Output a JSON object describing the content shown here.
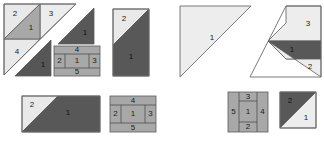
{
  "diagram": {
    "background": "#ffffff",
    "palette": {
      "light": "#e9e9e9",
      "light_alt": "#ededed",
      "medium": "#a8a8a8",
      "medium_alt": "#b0b0b0",
      "dark": "#585858",
      "dark_alt": "#565656",
      "outline": "#6b6b6b",
      "label_text": "#1b1b1b"
    },
    "figures": [
      {
        "id": "figure-1",
        "name": "large-triangle-with-square-inset",
        "kind": "triangle",
        "regions": [
          {
            "label": "2",
            "shade": "light"
          },
          {
            "label": "1",
            "shade": "medium"
          },
          {
            "label": "3",
            "shade": "light"
          },
          {
            "label": "4",
            "shade": "light"
          }
        ]
      },
      {
        "id": "figure-2",
        "name": "dark-triangle-upper",
        "kind": "triangle",
        "regions": [
          {
            "label": "1",
            "shade": "dark"
          }
        ]
      },
      {
        "id": "figure-3",
        "name": "dark-triangle-lower",
        "kind": "triangle",
        "regions": [
          {
            "label": "1",
            "shade": "dark"
          }
        ]
      },
      {
        "id": "figure-4",
        "name": "five-region-square-upper",
        "kind": "square",
        "regions": [
          {
            "label": "4",
            "shade": "medium"
          },
          {
            "label": "2",
            "shade": "medium"
          },
          {
            "label": "1",
            "shade": "medium"
          },
          {
            "label": "3",
            "shade": "medium"
          },
          {
            "label": "5",
            "shade": "medium"
          }
        ]
      },
      {
        "id": "figure-5",
        "name": "tall-rectangle-two-region",
        "kind": "rectangle",
        "regions": [
          {
            "label": "2",
            "shade": "light"
          },
          {
            "label": "1",
            "shade": "dark"
          }
        ]
      },
      {
        "id": "figure-6",
        "name": "wide-rectangle-two-region",
        "kind": "rectangle",
        "regions": [
          {
            "label": "2",
            "shade": "light"
          },
          {
            "label": "1",
            "shade": "dark"
          }
        ]
      },
      {
        "id": "figure-7",
        "name": "five-region-square-lower",
        "kind": "square",
        "regions": [
          {
            "label": "4",
            "shade": "medium"
          },
          {
            "label": "2",
            "shade": "medium"
          },
          {
            "label": "1",
            "shade": "medium"
          },
          {
            "label": "3",
            "shade": "medium"
          },
          {
            "label": "5",
            "shade": "medium"
          }
        ]
      },
      {
        "id": "figure-8",
        "name": "large-light-triangle",
        "kind": "triangle",
        "regions": [
          {
            "label": "1",
            "shade": "light"
          }
        ]
      },
      {
        "id": "figure-9",
        "name": "triangle-three-region",
        "kind": "triangle",
        "regions": [
          {
            "label": "3",
            "shade": "light"
          },
          {
            "label": "1",
            "shade": "dark"
          },
          {
            "label": "2",
            "shade": "light"
          }
        ]
      },
      {
        "id": "figure-10",
        "name": "five-region-square-right",
        "kind": "square",
        "regions": [
          {
            "label": "3",
            "shade": "medium"
          },
          {
            "label": "5",
            "shade": "medium"
          },
          {
            "label": "1",
            "shade": "medium"
          },
          {
            "label": "4",
            "shade": "medium"
          },
          {
            "label": "2",
            "shade": "medium"
          }
        ]
      },
      {
        "id": "figure-11",
        "name": "square-two-region-dark-light",
        "kind": "square",
        "regions": [
          {
            "label": "2",
            "shade": "dark"
          },
          {
            "label": "1",
            "shade": "light"
          }
        ]
      }
    ]
  }
}
